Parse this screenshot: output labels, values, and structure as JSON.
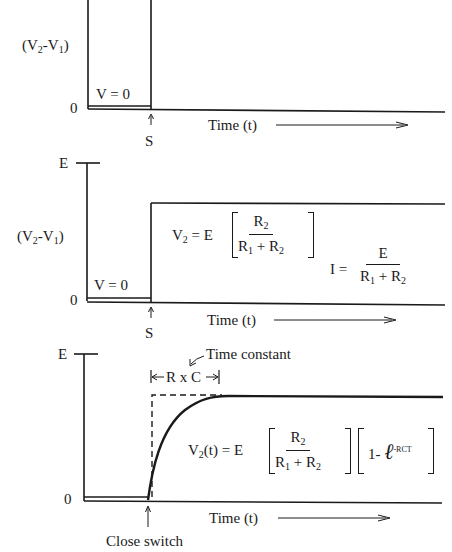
{
  "panels": [
    {
      "id": "top",
      "y_axis_label": "(V2-V1)",
      "zero_label": "0",
      "before_switch_label": "V = 0",
      "switch_marker": "S",
      "x_axis_label": "Time (t)"
    },
    {
      "id": "middle",
      "top_label": "E",
      "y_axis_label": "(V2-V1)",
      "zero_label": "0",
      "before_switch_label": "V = 0",
      "switch_marker": "S",
      "x_axis_label": "Time (t)",
      "equation_v2": {
        "lhs": "V",
        "lhs_sub": "2",
        "eq": "= E",
        "num": "R",
        "num_sub": "2",
        "den_a": "R",
        "den_a_sub": "1",
        "den_plus": "+",
        "den_b": "R",
        "den_b_sub": "2"
      },
      "equation_i": {
        "lhs": "I =",
        "num": "E",
        "den_a": "R",
        "den_a_sub": "1",
        "den_plus": "+",
        "den_b": "R",
        "den_b_sub": "2"
      }
    },
    {
      "id": "bottom",
      "top_label": "E",
      "zero_label": "0",
      "annotation": "Time constant",
      "rc_label": "R x C",
      "switch_marker": "Close switch",
      "x_axis_label": "Time (t)",
      "equation_v2t": {
        "lhs": "V",
        "lhs_sub": "2",
        "lhs_arg": "(t)",
        "eq": "= E",
        "num": "R",
        "num_sub": "2",
        "den_a": "R",
        "den_a_sub": "1",
        "den_plus": "+",
        "den_b": "R",
        "den_b_sub": "2",
        "factor": "1-",
        "exp_base": "ℓ",
        "exp": "-RCT"
      }
    }
  ]
}
